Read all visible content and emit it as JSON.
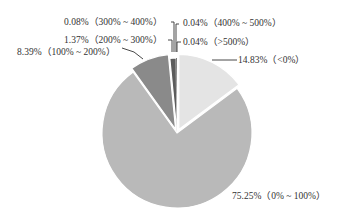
{
  "chart_data": {
    "type": "pie",
    "title": "",
    "start_angle": "12 o'clock",
    "direction": "clockwise",
    "slices": [
      {
        "label": "<0%",
        "value": 14.83,
        "display": "14.83%（<0%）",
        "color": "#e4e4e4",
        "exploded": true
      },
      {
        "label": "0% ~ 100%",
        "value": 75.25,
        "display": "75.25%（0% ~ 100%）",
        "color": "#b9b9b9",
        "exploded": false
      },
      {
        "label": "100% ~ 200%",
        "value": 8.39,
        "display": "8.39%（100% ~ 200%）",
        "color": "#8a8a8a",
        "exploded": true
      },
      {
        "label": "200% ~ 300%",
        "value": 1.37,
        "display": "1.37%（200% ~ 300%）",
        "color": "#5c5c5c",
        "exploded": false
      },
      {
        "label": "300% ~ 400%",
        "value": 0.08,
        "display": "0.08%（300% ~ 400%）",
        "color": "#3a3a3a",
        "exploded": false
      },
      {
        "label": "400% ~ 500%",
        "value": 0.04,
        "display": "0.04%（400% ~ 500%）",
        "color": "#2a2a2a",
        "exploded": false
      },
      {
        "label": ">500%",
        "value": 0.04,
        "display": "0.04%（>500%）",
        "color": "#1a1a1a",
        "exploded": false
      }
    ],
    "legend": "none (callout labels with leader lines)"
  },
  "labels": {
    "l0": "14.83%（<0%）",
    "l1": "75.25%（0% ~ 100%）",
    "l2": "8.39%（100% ~ 200%）",
    "l3": "1.37%（200% ~ 300%）",
    "l4": "0.08%（300% ~ 400%）",
    "l5": "0.04%（400% ~ 500%）",
    "l6": "0.04%（>500%）"
  }
}
